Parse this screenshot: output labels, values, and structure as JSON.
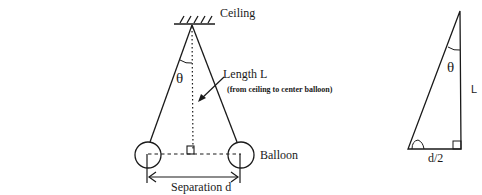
{
  "pendulum": {
    "ceiling_label": "Ceiling",
    "length_label": "Length L",
    "length_note": "(from ceiling to center balloon)",
    "angle_symbol": "θ",
    "balloon_label": "Balloon",
    "separation_label": "Separation d"
  },
  "triangle": {
    "angle_symbol": "θ",
    "vertical_side_label": "L",
    "base_label": "d/2"
  }
}
